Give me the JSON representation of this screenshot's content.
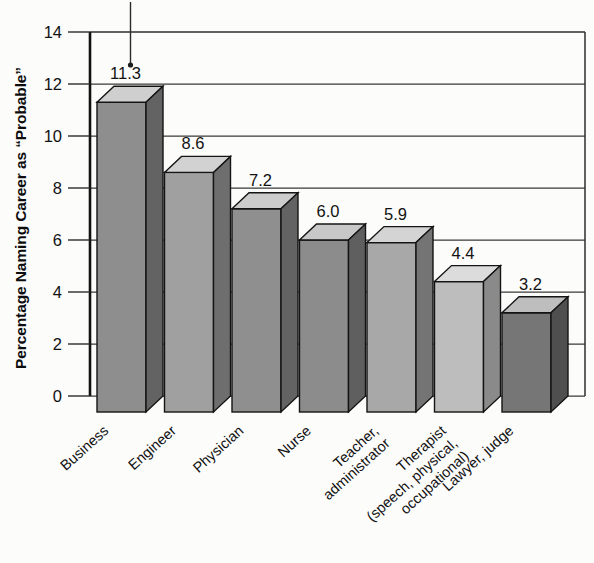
{
  "chart_data": {
    "type": "bar",
    "title": "",
    "xlabel": "",
    "ylabel": "Percentage Naming Career as “Probable”",
    "ylim": [
      0,
      14
    ],
    "yticks": [
      0,
      2,
      4,
      6,
      8,
      10,
      12,
      14
    ],
    "ytick_labels": [
      "0",
      "2",
      "4",
      "6",
      "8",
      "10",
      "12",
      "14"
    ],
    "grid": "horizontal",
    "legend": "none",
    "three_d": true,
    "categories": [
      "Business",
      "Engineer",
      "Physician",
      "Nurse",
      "Teacher, administrator",
      "Therapist (speech, physical, occupational)",
      "Lawyer, judge"
    ],
    "category_label_lines": [
      [
        "Business"
      ],
      [
        "Engineer"
      ],
      [
        "Physician"
      ],
      [
        "Nurse"
      ],
      [
        "Teacher,",
        "administrator"
      ],
      [
        "Therapist",
        "(speech, physical,",
        "occupational)"
      ],
      [
        "Lawyer, judge"
      ]
    ],
    "values": [
      11.3,
      8.6,
      7.2,
      6.0,
      5.9,
      4.4,
      3.2
    ],
    "value_labels": [
      "11.3",
      "8.6",
      "7.2",
      "6.0",
      "5.9",
      "4.4",
      "3.2"
    ],
    "bar_face_colors": [
      "#8e8e8e",
      "#a0a0a0",
      "#8f8f8f",
      "#8c8c8c",
      "#a8a8a8",
      "#bdbdbd",
      "#767676"
    ],
    "bar_top_colors": [
      "#cfcfcf",
      "#d2d2d2",
      "#cccccc",
      "#c8c8c8",
      "#d4d4d4",
      "#dcdcdc",
      "#bebebe"
    ],
    "bar_side_colors": [
      "#636363",
      "#6e6e6e",
      "#636363",
      "#5f5f5f",
      "#747474",
      "#8a8a8a",
      "#4f4f4f"
    ]
  },
  "colors": {
    "background": "#fcfcfb",
    "axis": "#111111",
    "grid": "#3a3a3a",
    "text": "#121212"
  },
  "artifacts": {
    "pointer_line_name": "scan-artifact-line"
  }
}
